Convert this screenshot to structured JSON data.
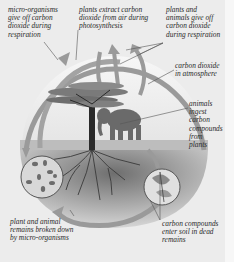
{
  "diagram": {
    "labels": {
      "micro_resp": "micro-organisms\ngive off carbon\ndioxide during\nrespiration",
      "photo": "plants extract carbon\ndioxide from air during\nphotosynthesis",
      "plants_animals_resp": "plants and\nanimals give off\ncarbon dioxide\nduring respiration",
      "co2_atmos": "carbon dioxide\nin atmosphere",
      "animals_ingest": "animals\ningest\ncarbon\ncompounds\nfrom\nplants",
      "remains_broken": "plant and animal\nremains broken down\nby micro-organisms",
      "carbon_soil": "carbon compounds\nenter soil in dead\nremains"
    },
    "icons": [
      "cycle-arrow-icon",
      "tree-icon",
      "elephant-icon",
      "roots-icon",
      "microbes-circle-icon",
      "dead-leaves-circle-icon"
    ],
    "colors": {
      "arrow": "#9a9a9a",
      "arrow_edge": "#7d7d7d",
      "soil": "#8f8f8f",
      "sky": "#f4f4f4",
      "background": "#ececec"
    }
  }
}
